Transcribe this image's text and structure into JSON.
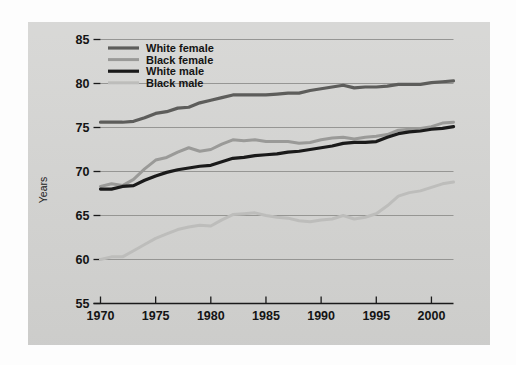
{
  "chart_data": {
    "type": "line",
    "title": "",
    "xlabel": "",
    "ylabel": "Years",
    "xlim": [
      1970,
      2002
    ],
    "ylim": [
      55,
      85
    ],
    "xticks": [
      1970,
      1975,
      1980,
      1985,
      1990,
      1995,
      2000
    ],
    "yticks": [
      55,
      60,
      65,
      70,
      75,
      80,
      85
    ],
    "grid": "horizontal",
    "legend_position": "top-left",
    "x": [
      1970,
      1971,
      1972,
      1973,
      1974,
      1975,
      1976,
      1977,
      1978,
      1979,
      1980,
      1981,
      1982,
      1983,
      1984,
      1985,
      1986,
      1987,
      1988,
      1989,
      1990,
      1991,
      1992,
      1993,
      1994,
      1995,
      1996,
      1997,
      1998,
      1999,
      2000,
      2001,
      2002
    ],
    "series": [
      {
        "name": "White female",
        "color": "#5d5d5b",
        "width": 3.2,
        "values": [
          75.6,
          75.6,
          75.6,
          75.7,
          76.1,
          76.6,
          76.8,
          77.2,
          77.3,
          77.8,
          78.1,
          78.4,
          78.7,
          78.7,
          78.7,
          78.7,
          78.8,
          78.9,
          78.9,
          79.2,
          79.4,
          79.6,
          79.8,
          79.5,
          79.6,
          79.6,
          79.7,
          79.9,
          79.9,
          79.9,
          80.1,
          80.2,
          80.3
        ]
      },
      {
        "name": "Black female",
        "color": "#9a9a98",
        "width": 3.0,
        "values": [
          68.3,
          68.6,
          68.4,
          69.1,
          70.3,
          71.3,
          71.6,
          72.2,
          72.7,
          72.3,
          72.5,
          73.1,
          73.6,
          73.5,
          73.6,
          73.4,
          73.4,
          73.4,
          73.2,
          73.3,
          73.6,
          73.8,
          73.9,
          73.7,
          73.9,
          74.0,
          74.2,
          74.7,
          74.8,
          74.9,
          75.1,
          75.5,
          75.6
        ]
      },
      {
        "name": "White male",
        "color": "#1a1a1a",
        "width": 3.2,
        "values": [
          68.0,
          68.0,
          68.3,
          68.4,
          69.0,
          69.5,
          69.9,
          70.2,
          70.4,
          70.6,
          70.7,
          71.1,
          71.5,
          71.6,
          71.8,
          71.9,
          72.0,
          72.2,
          72.3,
          72.5,
          72.7,
          72.9,
          73.2,
          73.3,
          73.3,
          73.4,
          73.9,
          74.3,
          74.5,
          74.6,
          74.8,
          74.9,
          75.1
        ]
      },
      {
        "name": "Black male",
        "color": "#bdbdbb",
        "width": 3.0,
        "values": [
          60.0,
          60.3,
          60.3,
          61.0,
          61.7,
          62.4,
          62.9,
          63.4,
          63.7,
          63.9,
          63.8,
          64.5,
          65.1,
          65.2,
          65.3,
          65.0,
          64.8,
          64.7,
          64.4,
          64.3,
          64.5,
          64.6,
          65.0,
          64.6,
          64.8,
          65.2,
          66.1,
          67.2,
          67.6,
          67.8,
          68.2,
          68.6,
          68.8
        ]
      }
    ]
  },
  "legend": {
    "items": [
      {
        "label": "White female"
      },
      {
        "label": "Black female"
      },
      {
        "label": "White male"
      },
      {
        "label": "Black male"
      }
    ]
  },
  "axes": {
    "y_title": "Years",
    "y_tick_labels": [
      "85",
      "80",
      "75",
      "70",
      "65",
      "60",
      "55"
    ],
    "x_tick_labels": [
      "1970",
      "1975",
      "1980",
      "1985",
      "1990",
      "1995",
      "2000"
    ]
  }
}
